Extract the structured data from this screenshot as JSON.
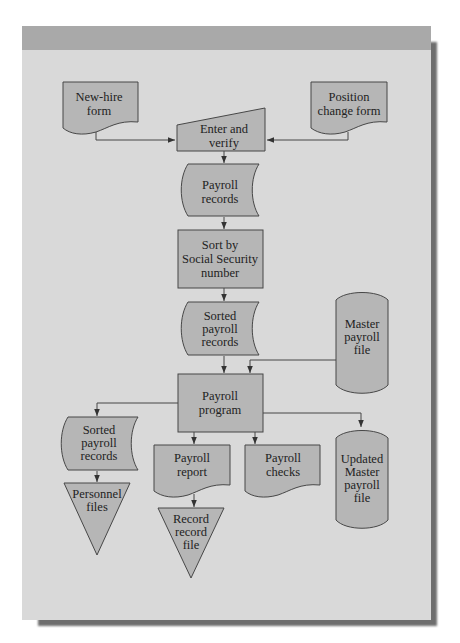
{
  "diagram": {
    "type": "flowchart",
    "title": "",
    "colors": {
      "page_background": "#d9d9d9",
      "header_band": "#a9a9a9",
      "shape_fill": "#b6b6b6",
      "outline": "#474747",
      "text": "#222222"
    },
    "nodes": [
      {
        "id": "new-hire-form",
        "shape": "document",
        "lines": [
          "New-hire",
          "form"
        ]
      },
      {
        "id": "position-change-form",
        "shape": "document",
        "lines": [
          "Position",
          "change form"
        ]
      },
      {
        "id": "enter-and-verify",
        "shape": "manual-input",
        "lines": [
          "Enter and",
          "verify"
        ]
      },
      {
        "id": "payroll-records",
        "shape": "stored-data",
        "lines": [
          "Payroll",
          "records"
        ]
      },
      {
        "id": "sort-by-ssn",
        "shape": "process",
        "lines": [
          "Sort by",
          "Social Security",
          "number"
        ]
      },
      {
        "id": "sorted-payroll-records",
        "shape": "stored-data",
        "lines": [
          "Sorted",
          "payroll",
          "records"
        ]
      },
      {
        "id": "master-payroll-file",
        "shape": "tape",
        "lines": [
          "Master",
          "payroll",
          "file"
        ]
      },
      {
        "id": "payroll-program",
        "shape": "process",
        "lines": [
          "Payroll",
          "program"
        ]
      },
      {
        "id": "sorted-payroll-records-2",
        "shape": "stored-data",
        "lines": [
          "Sorted",
          "payroll",
          "records"
        ]
      },
      {
        "id": "personnel-files",
        "shape": "offline-storage",
        "lines": [
          "Personnel",
          "files"
        ]
      },
      {
        "id": "payroll-report",
        "shape": "document",
        "lines": [
          "Payroll",
          "report"
        ]
      },
      {
        "id": "record-record-file",
        "shape": "offline-storage",
        "lines": [
          "Record",
          "record",
          "file"
        ]
      },
      {
        "id": "payroll-checks",
        "shape": "document",
        "lines": [
          "Payroll",
          "checks"
        ]
      },
      {
        "id": "updated-master-payroll-file",
        "shape": "tape",
        "lines": [
          "Updated",
          "Master",
          "payroll",
          "file"
        ]
      }
    ],
    "edges": [
      {
        "from": "new-hire-form",
        "to": "enter-and-verify"
      },
      {
        "from": "position-change-form",
        "to": "enter-and-verify"
      },
      {
        "from": "enter-and-verify",
        "to": "payroll-records"
      },
      {
        "from": "payroll-records",
        "to": "sort-by-ssn"
      },
      {
        "from": "sort-by-ssn",
        "to": "sorted-payroll-records"
      },
      {
        "from": "sorted-payroll-records",
        "to": "payroll-program"
      },
      {
        "from": "master-payroll-file",
        "to": "payroll-program"
      },
      {
        "from": "payroll-program",
        "to": "sorted-payroll-records-2"
      },
      {
        "from": "payroll-program",
        "to": "payroll-report"
      },
      {
        "from": "payroll-program",
        "to": "payroll-checks"
      },
      {
        "from": "payroll-program",
        "to": "updated-master-payroll-file"
      },
      {
        "from": "sorted-payroll-records-2",
        "to": "personnel-files"
      },
      {
        "from": "payroll-report",
        "to": "record-record-file"
      }
    ]
  },
  "labels": {
    "new_hire": [
      "New-hire",
      "form"
    ],
    "position_change": [
      "Position",
      "change form"
    ],
    "enter_verify": [
      "Enter and",
      "verify"
    ],
    "payroll_records": [
      "Payroll",
      "records"
    ],
    "sort_ssn": [
      "Sort by",
      "Social Security",
      "number"
    ],
    "sorted_records": [
      "Sorted",
      "payroll",
      "records"
    ],
    "master_file": [
      "Master",
      "payroll",
      "file"
    ],
    "payroll_program": [
      "Payroll",
      "program"
    ],
    "sorted_records_2": [
      "Sorted",
      "payroll",
      "records"
    ],
    "personnel_files": [
      "Personnel",
      "files"
    ],
    "payroll_report": [
      "Payroll",
      "report"
    ],
    "record_file": [
      "Record",
      "record",
      "file"
    ],
    "payroll_checks": [
      "Payroll",
      "checks"
    ],
    "updated_master": [
      "Updated",
      "Master",
      "payroll",
      "file"
    ]
  }
}
